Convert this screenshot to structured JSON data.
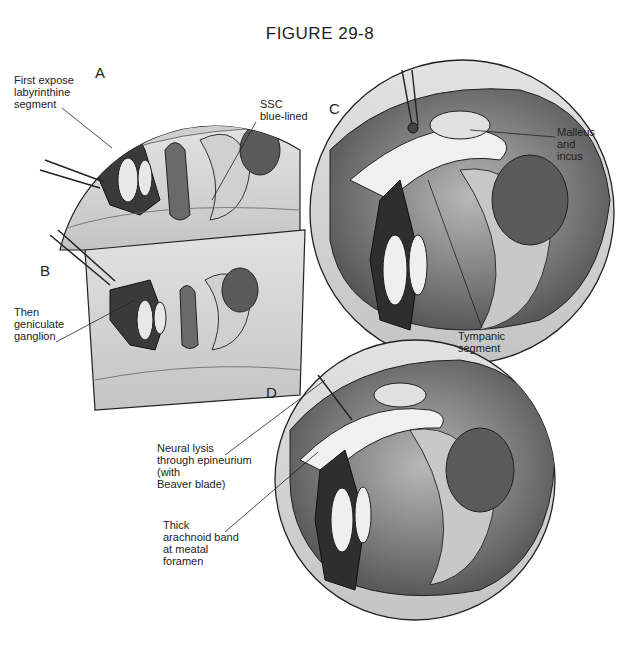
{
  "figure": {
    "title": "FIGURE 29-8",
    "panels": [
      {
        "id": "A",
        "letter": "A"
      },
      {
        "id": "B",
        "letter": "B"
      },
      {
        "id": "C",
        "letter": "C"
      },
      {
        "id": "D",
        "letter": "D"
      }
    ],
    "labels": {
      "first_expose": "First expose\nlabyrinthine\nsegment",
      "ssc": "SSC\nblue-lined",
      "geniculate": "Then\ngeniculate\nganglion",
      "malleus_incus": "Malleus\nand\nincus",
      "tympanic": "Tympanic\nsegment",
      "neural_lysis": "Neural lysis\nthrough epineurium\n(with\nBeaver blade)",
      "arachnoid": "Thick\narachnoid band\nat meatal\nforamen"
    },
    "colors": {
      "ink": "#222222",
      "tissue_dark": "#3a3a3a",
      "tissue_mid": "#8a8a8a",
      "tissue_light": "#d8d8d8",
      "background": "#ffffff"
    }
  }
}
